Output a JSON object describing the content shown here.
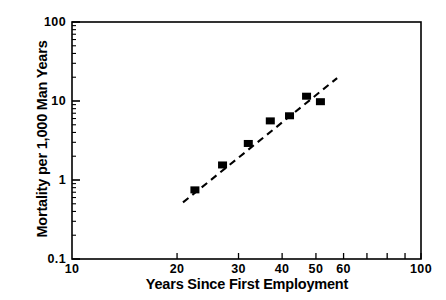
{
  "chart_data": {
    "type": "scatter",
    "title": "",
    "xlabel": "Years Since First Employment",
    "ylabel": "Mortality per 1,000 Man Years",
    "xscale": "log",
    "yscale": "log",
    "xlim": [
      10,
      100
    ],
    "ylim": [
      0.1,
      100
    ],
    "grid": false,
    "legend": null,
    "xticks": [
      {
        "value": 10,
        "label": "10"
      },
      {
        "value": 20,
        "label": "20"
      },
      {
        "value": 30,
        "label": "30"
      },
      {
        "value": 40,
        "label": "40"
      },
      {
        "value": 50,
        "label": "50"
      },
      {
        "value": 60,
        "label": "60"
      },
      {
        "value": 100,
        "label": "100"
      }
    ],
    "xminorticks": [
      20,
      30,
      40,
      50,
      60,
      70,
      80,
      90,
      100
    ],
    "yticks": [
      {
        "value": 100,
        "label": "100"
      },
      {
        "value": 10,
        "label": "10"
      },
      {
        "value": 1,
        "label": "1"
      },
      {
        "value": 0.1,
        "label": "0.1"
      }
    ],
    "series": [
      {
        "name": "Observed mortality",
        "marker": "square",
        "marker_color": "#000000",
        "points": [
          {
            "x": 22.5,
            "y": 0.75
          },
          {
            "x": 27.0,
            "y": 1.55
          },
          {
            "x": 32.0,
            "y": 2.9
          },
          {
            "x": 37.0,
            "y": 5.6
          },
          {
            "x": 42.0,
            "y": 6.5
          },
          {
            "x": 47.0,
            "y": 11.5
          },
          {
            "x": 51.5,
            "y": 9.8
          }
        ]
      },
      {
        "name": "Fitted trend",
        "style": "dashed",
        "line_color": "#000000",
        "endpoints": [
          {
            "x": 20.8,
            "y": 0.52
          },
          {
            "x": 57.5,
            "y": 19.5
          }
        ]
      }
    ]
  },
  "axis": {
    "x_title": "Years Since First Employment",
    "y_title": "Mortality per 1,000 Man Years"
  }
}
